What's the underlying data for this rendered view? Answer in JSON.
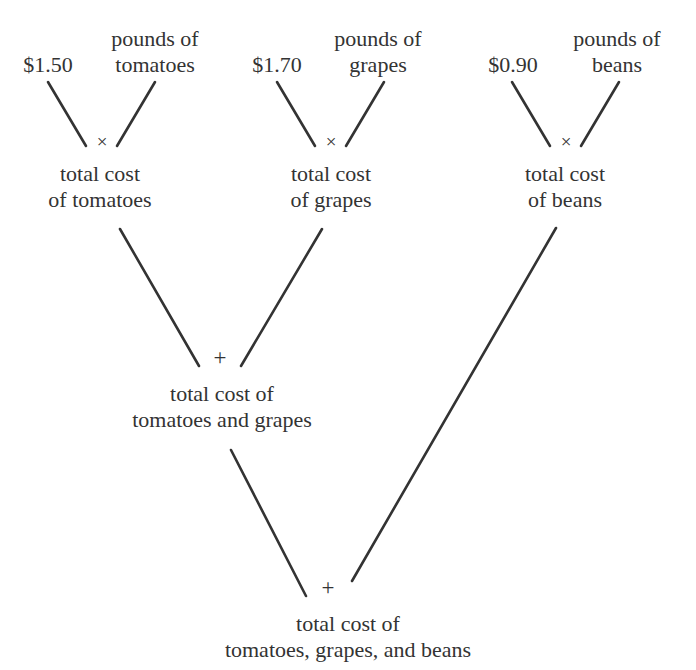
{
  "diagram": {
    "type": "expression-tree",
    "text_color": "#333333",
    "background_color": "#ffffff",
    "leaves": [
      {
        "id": "price-tomatoes",
        "label": "$1.50",
        "line1": "$1.50",
        "line2": ""
      },
      {
        "id": "pounds-tomatoes",
        "label": "pounds of tomatoes",
        "line1": "pounds of",
        "line2": "tomatoes"
      },
      {
        "id": "price-grapes",
        "label": "$1.70",
        "line1": "$1.70",
        "line2": ""
      },
      {
        "id": "pounds-grapes",
        "label": "pounds of grapes",
        "line1": "pounds of",
        "line2": "grapes"
      },
      {
        "id": "price-beans",
        "label": "$0.90",
        "line1": "$0.90",
        "line2": ""
      },
      {
        "id": "pounds-beans",
        "label": "pounds of beans",
        "line1": "pounds of",
        "line2": "beans"
      }
    ],
    "operators": [
      {
        "id": "times-tomatoes",
        "symbol": "×",
        "name": "multiply"
      },
      {
        "id": "times-grapes",
        "symbol": "×",
        "name": "multiply"
      },
      {
        "id": "times-beans",
        "symbol": "×",
        "name": "multiply"
      },
      {
        "id": "plus-tomatoes-grapes",
        "symbol": "+",
        "name": "add"
      },
      {
        "id": "plus-all",
        "symbol": "+",
        "name": "add"
      }
    ],
    "internal_nodes": [
      {
        "id": "total-tomatoes",
        "label": "total cost of tomatoes",
        "line1": "total cost",
        "line2": "of tomatoes"
      },
      {
        "id": "total-grapes",
        "label": "total cost of grapes",
        "line1": "total cost",
        "line2": "of grapes"
      },
      {
        "id": "total-beans",
        "label": "total cost of beans",
        "line1": "total cost",
        "line2": "of beans"
      },
      {
        "id": "total-tomatoes-grapes",
        "label": "total cost of tomatoes and grapes",
        "line1": "total cost of",
        "line2": "tomatoes and grapes"
      },
      {
        "id": "total-all",
        "label": "total cost of tomatoes, grapes, and beans",
        "line1": "total cost of",
        "line2": "tomatoes, grapes, and beans"
      }
    ]
  }
}
